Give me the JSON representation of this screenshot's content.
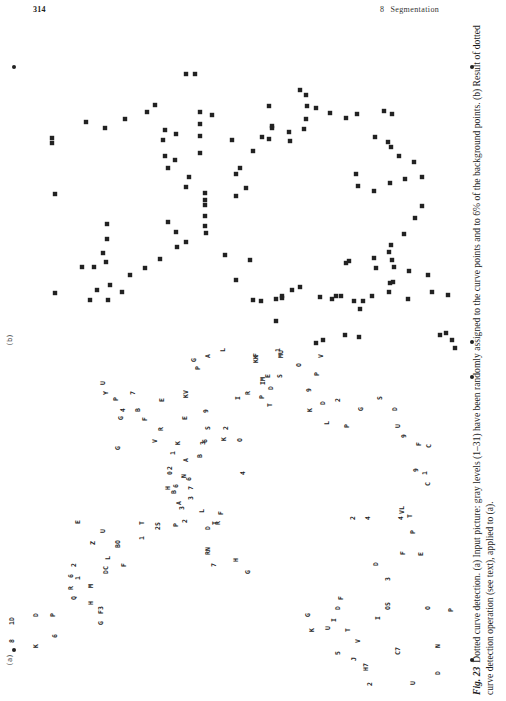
{
  "header": {
    "page_number": "314",
    "chapter_number": "8",
    "chapter_title": "Segmentation"
  },
  "figure": {
    "panels": [
      {
        "label": "(a)",
        "description": "Input picture with characters"
      },
      {
        "label": "(b)",
        "description": "Result of dotted curve detection"
      }
    ],
    "panel_a_characters": [
      "(a)",
      "8",
      "1D",
      "K",
      "D",
      "P",
      "6",
      "Q",
      "R",
      "6",
      "H",
      "F3",
      "G",
      "1",
      "2",
      "M",
      "DC",
      "L",
      "BO",
      "F",
      "Z",
      "U",
      "E",
      "T",
      "1",
      "2S",
      "3",
      "2",
      "P",
      "N",
      "A",
      "7",
      "3",
      "H",
      "2",
      "0",
      "1",
      "K",
      "G",
      "B",
      "6",
      "6",
      "L",
      "D",
      "T",
      "R",
      "F",
      "RN",
      "7",
      "G",
      "H",
      "A",
      "B",
      "3",
      "S",
      "2",
      "9",
      "E",
      "4",
      "V",
      "6",
      "K",
      "O",
      "R",
      "F",
      "G",
      "P",
      "Y",
      "U",
      "7",
      "4",
      "B",
      "E",
      "KV",
      "P",
      "G",
      "A",
      "L",
      "IM",
      "T",
      "I",
      "F",
      "KK",
      "R",
      "P",
      "D",
      "1",
      "E",
      "MU",
      "S",
      "O",
      "9",
      "P",
      "V",
      "K",
      "D",
      "L",
      "2",
      "P",
      "G",
      "S",
      "D",
      "U",
      "F",
      "C",
      "9",
      "1",
      "9",
      "C",
      "4",
      "T",
      "VL",
      "P",
      "F",
      "D",
      "3",
      "E",
      "D",
      "F",
      "I",
      "T",
      "5",
      "J",
      "G",
      "K",
      "U",
      "V",
      "H7",
      "2",
      "C7",
      "U",
      "O",
      "D",
      "N",
      "P",
      "I",
      "OS",
      "2",
      "4"
    ],
    "panel_b_description": "Detected dotted curves shown as square marks"
  },
  "caption": {
    "fig_label": "Fig. 23",
    "text": "Dotted curve detection. (a) Input picture: gray levels (1–31) have been randomly assigned to the curve points and to 6% of the background points. (b) Result of dotted curve detection operation (see text), applied to (a)."
  }
}
